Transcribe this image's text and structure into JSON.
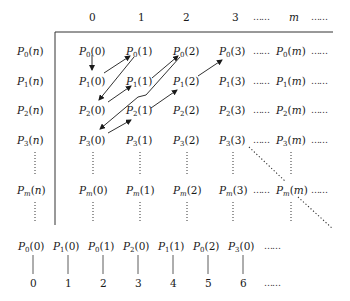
{
  "column_headers": [
    "0",
    "1",
    "2",
    "3",
    "……",
    "m",
    "……"
  ],
  "row_labels": [
    "P0(n)",
    "P1(n)",
    "P2(n)",
    "P3(n)",
    "⋮",
    "Pm(n)",
    "⋮"
  ],
  "grid": [
    [
      "P0(0)",
      "P0(1)",
      "P0(2)",
      "P0(3)",
      "……",
      "P0(m)",
      "……"
    ],
    [
      "P1(0)",
      "P1(1)",
      "P1(2)",
      "P1(3)",
      "……",
      "P1(m)",
      "……"
    ],
    [
      "P2(0)",
      "P2(1)",
      "P2(2)",
      "P2(3)",
      "……",
      "P2(m)",
      "……"
    ],
    [
      "P3(0)",
      "P3(1)",
      "P3(2)",
      "P3(3)",
      "……",
      "P3(m)",
      "……"
    ],
    [
      "Pm(0)",
      "Pm(1)",
      "Pm(2)",
      "Pm(3)",
      "……",
      "Pm(m)",
      "……"
    ]
  ],
  "enumeration": {
    "sequence": [
      "P0(0)",
      "P1(0)",
      "P0(1)",
      "P2(0)",
      "P1(1)",
      "P0(2)",
      "P3(0)",
      "……"
    ],
    "indices": [
      "0",
      "1",
      "2",
      "3",
      "4",
      "5",
      "6",
      "……"
    ]
  },
  "arrows": [
    {
      "from": "P0(0)",
      "to": "P1(0)"
    },
    {
      "from": "P1(0)",
      "to": "P0(1)"
    },
    {
      "from": "P0(1)",
      "to": "P2(0)"
    },
    {
      "from": "P2(0)",
      "to": "P1(1)"
    },
    {
      "from": "P1(1)",
      "to": "P0(2)"
    },
    {
      "from": "P0(2)",
      "to": "P3(0)"
    },
    {
      "from": "P3(0)",
      "to": "P2(1)"
    },
    {
      "from": "P2(1)",
      "to": "P1(2)"
    },
    {
      "from": "P1(2)",
      "to": "P0(3)"
    }
  ],
  "diagonal": {
    "style": "dotted",
    "from": "P3(3)",
    "through": "Pm(m)"
  }
}
